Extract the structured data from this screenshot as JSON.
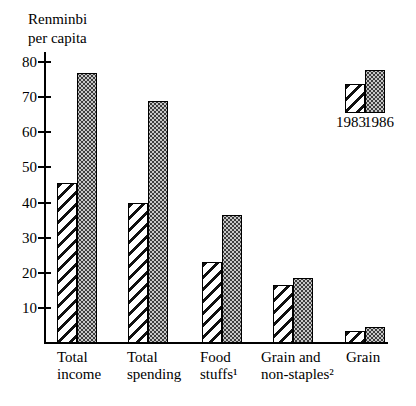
{
  "chart_data": {
    "type": "bar",
    "title": "Renminbi per capita",
    "title_lines": [
      "Renminbi",
      "per capita"
    ],
    "xlabel": "",
    "ylabel": "Renminbi per capita",
    "categories": [
      "Total income",
      "Total spending",
      "Food stuffs¹",
      "Grain and non-staples²",
      "Grain"
    ],
    "category_lines": [
      [
        "Total",
        "income"
      ],
      [
        "Total",
        "spending"
      ],
      [
        "Food",
        "stuffs¹"
      ],
      [
        "Grain and",
        "non-staples²"
      ],
      [
        "Grain"
      ]
    ],
    "series": [
      {
        "name": "1983",
        "pattern": "diagonal-hatch",
        "values": [
          45.5,
          40,
          23,
          16.5,
          3.5
        ]
      },
      {
        "name": "1986",
        "pattern": "halftone-dots",
        "values": [
          77,
          69,
          36.5,
          18.5,
          4.5
        ]
      }
    ],
    "ylim": [
      0,
      80
    ],
    "yticks": [
      10,
      20,
      30,
      40,
      50,
      60,
      70,
      80
    ],
    "grid": false,
    "legend_position": "top-right",
    "legend_labels": [
      "1983",
      "1986"
    ]
  },
  "colors": {
    "ink": "#000000",
    "background": "#ffffff",
    "bar_1986_average_gray": "#909090"
  }
}
